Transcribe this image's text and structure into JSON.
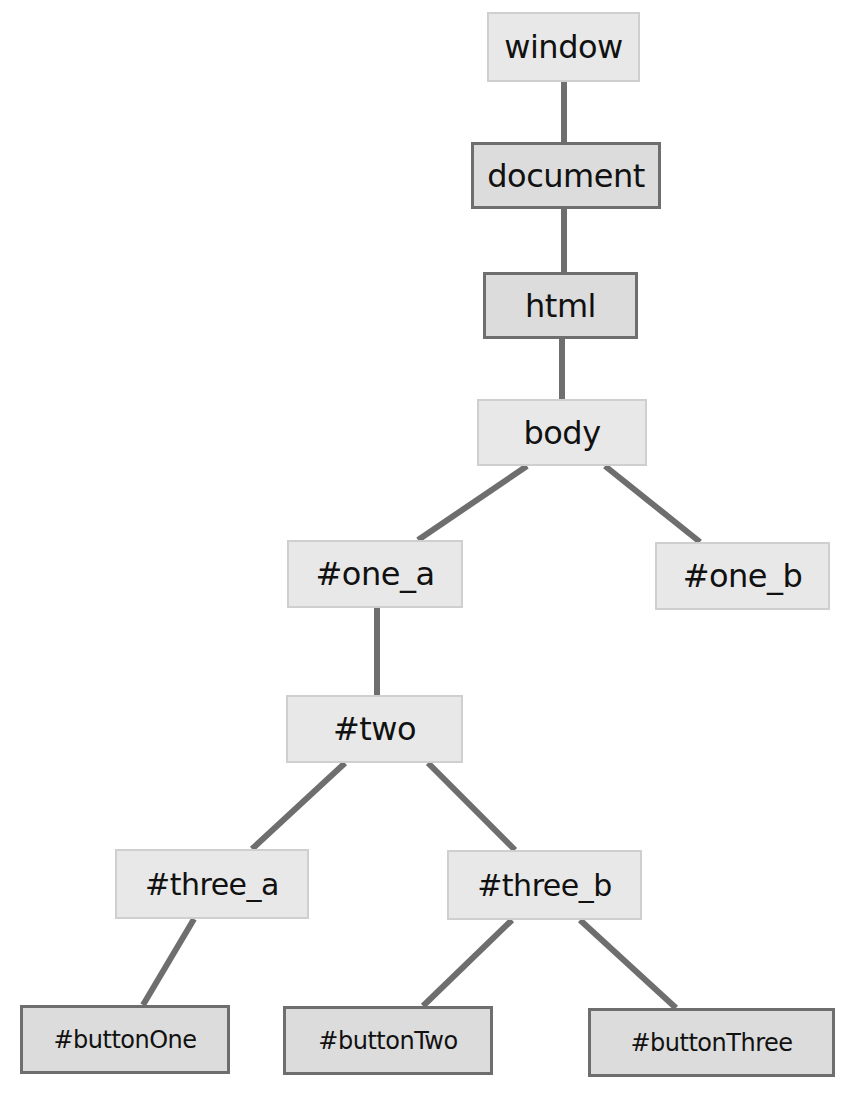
{
  "diagram": {
    "type": "tree",
    "edge_color": "#6e6e6e",
    "nodes": [
      {
        "id": "window",
        "label": "window",
        "style": "light",
        "x": 487,
        "y": 12,
        "w": 153,
        "h": 70,
        "font": 32
      },
      {
        "id": "document",
        "label": "document",
        "style": "dark",
        "x": 471,
        "y": 142,
        "w": 190,
        "h": 67,
        "font": 32
      },
      {
        "id": "html",
        "label": "html",
        "style": "dark",
        "x": 483,
        "y": 272,
        "w": 155,
        "h": 67,
        "font": 32
      },
      {
        "id": "body",
        "label": "body",
        "style": "light",
        "x": 477,
        "y": 399,
        "w": 170,
        "h": 67,
        "font": 32
      },
      {
        "id": "one_a",
        "label": "#one_a",
        "style": "light",
        "x": 287,
        "y": 540,
        "w": 176,
        "h": 68,
        "font": 32
      },
      {
        "id": "one_b",
        "label": "#one_b",
        "style": "light",
        "x": 655,
        "y": 542,
        "w": 175,
        "h": 68,
        "font": 32
      },
      {
        "id": "two",
        "label": "#two",
        "style": "light",
        "x": 286,
        "y": 695,
        "w": 177,
        "h": 68,
        "font": 32
      },
      {
        "id": "three_a",
        "label": "#three_a",
        "style": "light",
        "x": 115,
        "y": 849,
        "w": 194,
        "h": 70,
        "font": 30
      },
      {
        "id": "three_b",
        "label": "#three_b",
        "style": "light",
        "x": 447,
        "y": 850,
        "w": 195,
        "h": 70,
        "font": 30
      },
      {
        "id": "buttonOne",
        "label": "#buttonOne",
        "style": "dark",
        "x": 20,
        "y": 1005,
        "w": 210,
        "h": 69,
        "font": 24
      },
      {
        "id": "buttonTwo",
        "label": "#buttonTwo",
        "style": "dark",
        "x": 283,
        "y": 1006,
        "w": 210,
        "h": 69,
        "font": 24
      },
      {
        "id": "buttonThree",
        "label": "#buttonThree",
        "style": "dark",
        "x": 588,
        "y": 1008,
        "w": 247,
        "h": 69,
        "font": 24
      }
    ],
    "edges": [
      {
        "from": "window",
        "to": "document",
        "x1": 564,
        "y1": 82,
        "x2": 564,
        "y2": 142
      },
      {
        "from": "document",
        "to": "html",
        "x1": 564,
        "y1": 209,
        "x2": 564,
        "y2": 272
      },
      {
        "from": "html",
        "to": "body",
        "x1": 562,
        "y1": 339,
        "x2": 562,
        "y2": 399
      },
      {
        "from": "body",
        "to": "one_a",
        "x1": 527,
        "y1": 466,
        "x2": 418,
        "y2": 540
      },
      {
        "from": "body",
        "to": "one_b",
        "x1": 605,
        "y1": 466,
        "x2": 700,
        "y2": 542
      },
      {
        "from": "one_a",
        "to": "two",
        "x1": 377,
        "y1": 608,
        "x2": 377,
        "y2": 695
      },
      {
        "from": "two",
        "to": "three_a",
        "x1": 345,
        "y1": 763,
        "x2": 252,
        "y2": 849
      },
      {
        "from": "two",
        "to": "three_b",
        "x1": 428,
        "y1": 763,
        "x2": 515,
        "y2": 850
      },
      {
        "from": "three_a",
        "to": "buttonOne",
        "x1": 194,
        "y1": 919,
        "x2": 143,
        "y2": 1005
      },
      {
        "from": "three_b",
        "to": "buttonTwo",
        "x1": 512,
        "y1": 920,
        "x2": 423,
        "y2": 1006
      },
      {
        "from": "three_b",
        "to": "buttonThree",
        "x1": 580,
        "y1": 920,
        "x2": 676,
        "y2": 1008
      }
    ]
  }
}
